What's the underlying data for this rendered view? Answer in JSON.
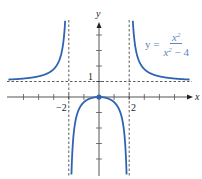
{
  "chart_data": {
    "type": "line",
    "title": "",
    "equation": {
      "lhs": "y =",
      "numerator": "x",
      "numerator_exp": "2",
      "denominator_base": "x",
      "denominator_exp": "2",
      "denominator_tail": " − 4"
    },
    "xlabel": "x",
    "ylabel": "y",
    "xlim": [
      -6,
      6
    ],
    "ylim": [
      -5,
      4
    ],
    "tick_labels": {
      "x_neg": "−2",
      "x_pos": "2",
      "y": "1"
    },
    "asymptotes": {
      "vertical": [
        -2,
        2
      ],
      "horizontal": [
        1
      ]
    },
    "point": {
      "x": 0,
      "y": 0
    },
    "series": [
      {
        "name": "y = x^2/(x^2 - 4)",
        "function": "x^2/(x^2-4)"
      }
    ],
    "grid": false,
    "colors": {
      "curve": "#2f64b0",
      "axis": "#555555",
      "asymptote": "#333333",
      "equation": "#5b86c2"
    }
  }
}
